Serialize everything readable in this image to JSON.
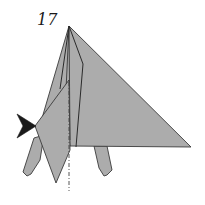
{
  "diagram": {
    "step_number": "17",
    "colors": {
      "paper_fill": "#acacac",
      "outline": "#3a3a3a",
      "arrow": "#1a1a1a",
      "background": "#ffffff"
    },
    "elements": [
      {
        "name": "main-body-triangle",
        "kind": "folded paper flap"
      },
      {
        "name": "left-front-flap",
        "kind": "folded paper flap"
      },
      {
        "name": "left-leg",
        "kind": "paper point"
      },
      {
        "name": "right-leg",
        "kind": "paper point"
      },
      {
        "name": "push-arrow",
        "kind": "sink / push-in arrow"
      },
      {
        "name": "center-dash-dot-line",
        "kind": "mountain fold line"
      }
    ]
  }
}
